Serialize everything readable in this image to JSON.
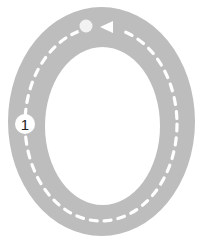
{
  "diagram": {
    "type": "race-track-loop",
    "colors": {
      "background": "#ffffff",
      "track": "#bdbdbd",
      "lane_line": "#ffffff",
      "start_dot": "#f2f2f2",
      "direction_arrow": "#ffffff",
      "marker_fill": "#ffffff",
      "marker_text": "#222222"
    },
    "track": {
      "outer": {
        "cx": 101.5,
        "cy": 121.5,
        "rx": 93.5,
        "ry": 114.5
      },
      "inner": {
        "cx": 102.5,
        "cy": 126,
        "rx": 57.5,
        "ry": 79
      },
      "centerline": {
        "cx": 101,
        "cy": 124,
        "rx": 76,
        "ry": 97
      }
    },
    "start": {
      "icon": "circle-dot",
      "x": 86,
      "y": 26
    },
    "direction": {
      "icon": "triangle-left",
      "label": "counter-clockwise"
    },
    "markers": [
      {
        "label": "1",
        "x": 25,
        "y": 124
      }
    ]
  }
}
